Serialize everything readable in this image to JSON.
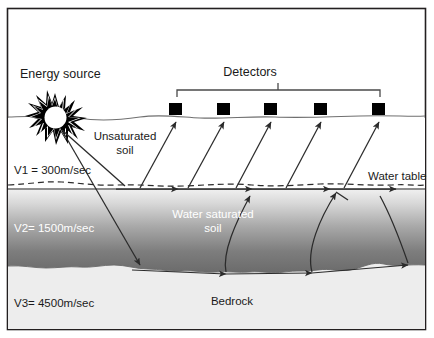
{
  "figure": {
    "type": "cross-section-diagram",
    "labels": {
      "energy_source": "Energy source",
      "detectors": "Detectors",
      "unsaturated_soil": "Unsaturated\nsoil",
      "unsaturated_soil_line1": "Unsaturated",
      "unsaturated_soil_line2": "soil",
      "water_saturated_soil_line1": "Water saturated",
      "water_saturated_soil_line2": "soil",
      "water_table": "Water table",
      "bedrock": "Bedrock",
      "v1": "V1 = 300m/sec",
      "v2": "V2= 1500m/sec",
      "v3": "V3= 4500m/sec"
    },
    "velocities": [
      {
        "id": "V1",
        "label": "V1 = 300m/sec",
        "value": 300,
        "unit": "m/sec",
        "layer": "Unsaturated soil"
      },
      {
        "id": "V2",
        "label": "V2= 1500m/sec",
        "value": 1500,
        "unit": "m/sec",
        "layer": "Water saturated soil"
      },
      {
        "id": "V3",
        "label": "V3= 4500m/sec",
        "value": 4500,
        "unit": "m/sec",
        "layer": "Bedrock"
      }
    ],
    "detector_count": 5,
    "colors": {
      "frame": "#231f20",
      "ink": "#1a1a1a",
      "ray": "#2b2b2b",
      "unsaturated_fill": "#ffffff",
      "saturated_top": "#f0f0f0",
      "saturated_bottom": "#6e6e6e",
      "bedrock_fill": "#ededed",
      "white_text": "#ffffff"
    }
  }
}
